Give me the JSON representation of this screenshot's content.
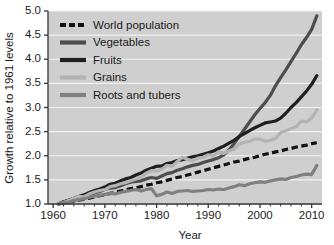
{
  "chart_data": {
    "type": "line",
    "title": "",
    "xlabel": "Year",
    "ylabel": "Growth relative to 1961 levels",
    "xlim": [
      1959,
      2012
    ],
    "ylim": [
      1.0,
      5.0
    ],
    "grid": true,
    "legend_position": "upper left",
    "xticks": [
      1960,
      1970,
      1980,
      1990,
      2000,
      2010
    ],
    "xtick_labels": [
      "1960",
      "1970",
      "1980",
      "1990",
      "2000",
      "2010"
    ],
    "yticks": [
      1.0,
      1.5,
      2.0,
      2.5,
      3.0,
      3.5,
      4.0,
      4.5,
      5.0
    ],
    "ytick_labels": [
      "1.0",
      "1.5",
      "2.0",
      "2.5",
      "3.0",
      "3.5",
      "4.0",
      "4.5",
      "5.0"
    ],
    "x": [
      1961,
      1962,
      1963,
      1964,
      1965,
      1966,
      1967,
      1968,
      1969,
      1970,
      1971,
      1972,
      1973,
      1974,
      1975,
      1976,
      1977,
      1978,
      1979,
      1980,
      1981,
      1982,
      1983,
      1984,
      1985,
      1986,
      1987,
      1988,
      1989,
      1990,
      1991,
      1992,
      1993,
      1994,
      1995,
      1996,
      1997,
      1998,
      1999,
      2000,
      2001,
      2002,
      2003,
      2004,
      2005,
      2006,
      2007,
      2008,
      2009,
      2010,
      2011
    ],
    "series": [
      {
        "name": "World population",
        "style": "dashed",
        "color": "#111111",
        "width": 3.2,
        "values": [
          1.0,
          1.02,
          1.04,
          1.06,
          1.08,
          1.1,
          1.12,
          1.15,
          1.17,
          1.19,
          1.22,
          1.24,
          1.27,
          1.29,
          1.32,
          1.34,
          1.36,
          1.39,
          1.41,
          1.44,
          1.46,
          1.49,
          1.52,
          1.55,
          1.57,
          1.6,
          1.63,
          1.66,
          1.69,
          1.72,
          1.75,
          1.78,
          1.81,
          1.84,
          1.87,
          1.89,
          1.92,
          1.95,
          1.97,
          2.0,
          2.03,
          2.05,
          2.08,
          2.1,
          2.13,
          2.15,
          2.18,
          2.2,
          2.22,
          2.25,
          2.27
        ]
      },
      {
        "name": "Vegetables",
        "style": "solid",
        "color": "#4d4d4d",
        "width": 3.2,
        "values": [
          1.0,
          1.05,
          1.07,
          1.1,
          1.13,
          1.16,
          1.2,
          1.23,
          1.26,
          1.3,
          1.33,
          1.34,
          1.38,
          1.42,
          1.45,
          1.47,
          1.48,
          1.52,
          1.55,
          1.53,
          1.58,
          1.63,
          1.65,
          1.7,
          1.73,
          1.77,
          1.8,
          1.82,
          1.86,
          1.89,
          1.92,
          1.96,
          2.02,
          2.12,
          2.25,
          2.4,
          2.55,
          2.7,
          2.85,
          2.98,
          3.1,
          3.25,
          3.45,
          3.62,
          3.78,
          3.95,
          4.12,
          4.3,
          4.45,
          4.62,
          4.9
        ]
      },
      {
        "name": "Fruits",
        "style": "solid",
        "color": "#1f1f1f",
        "width": 3.2,
        "values": [
          1.0,
          1.04,
          1.08,
          1.12,
          1.16,
          1.19,
          1.24,
          1.28,
          1.31,
          1.35,
          1.41,
          1.43,
          1.48,
          1.52,
          1.55,
          1.6,
          1.64,
          1.7,
          1.74,
          1.78,
          1.79,
          1.84,
          1.86,
          1.9,
          1.92,
          1.95,
          1.98,
          2.0,
          2.03,
          2.06,
          2.1,
          2.15,
          2.2,
          2.26,
          2.32,
          2.4,
          2.46,
          2.52,
          2.58,
          2.63,
          2.68,
          2.7,
          2.72,
          2.78,
          2.88,
          3.0,
          3.1,
          3.22,
          3.34,
          3.48,
          3.66
        ]
      },
      {
        "name": "Grains",
        "style": "solid",
        "color": "#b3b3b3",
        "width": 3.2,
        "values": [
          1.0,
          1.03,
          1.07,
          1.12,
          1.16,
          1.15,
          1.21,
          1.25,
          1.28,
          1.3,
          1.36,
          1.38,
          1.42,
          1.44,
          1.48,
          1.52,
          1.56,
          1.64,
          1.69,
          1.68,
          1.72,
          1.8,
          1.78,
          1.88,
          1.97,
          1.93,
          1.89,
          1.95,
          1.97,
          2.02,
          2.0,
          2.08,
          2.05,
          2.1,
          2.14,
          2.24,
          2.28,
          2.3,
          2.35,
          2.34,
          2.3,
          2.32,
          2.36,
          2.48,
          2.52,
          2.56,
          2.6,
          2.72,
          2.7,
          2.78,
          2.95
        ]
      },
      {
        "name": "Roots and tubers",
        "style": "solid",
        "color": "#808080",
        "width": 3.2,
        "values": [
          1.0,
          1.02,
          1.04,
          1.07,
          1.09,
          1.11,
          1.14,
          1.16,
          1.18,
          1.2,
          1.22,
          1.21,
          1.24,
          1.26,
          1.28,
          1.3,
          1.27,
          1.3,
          1.32,
          1.17,
          1.2,
          1.25,
          1.22,
          1.26,
          1.27,
          1.28,
          1.26,
          1.27,
          1.28,
          1.3,
          1.29,
          1.31,
          1.3,
          1.33,
          1.36,
          1.4,
          1.38,
          1.42,
          1.44,
          1.46,
          1.45,
          1.48,
          1.5,
          1.52,
          1.51,
          1.55,
          1.57,
          1.6,
          1.62,
          1.61,
          1.8
        ]
      }
    ],
    "legend_entries": [
      {
        "label": "World population",
        "style": "dashed",
        "color": "#111111"
      },
      {
        "label": "Vegetables",
        "style": "solid",
        "color": "#4d4d4d"
      },
      {
        "label": "Fruits",
        "style": "solid",
        "color": "#1f1f1f"
      },
      {
        "label": "Grains",
        "style": "solid",
        "color": "#b3b3b3"
      },
      {
        "label": "Roots and tubers",
        "style": "solid",
        "color": "#808080"
      }
    ],
    "colors": {
      "plot_background": "#cfcfcf",
      "gridline": "#f2f2f2",
      "axis": "#333333",
      "figure_background": "#ffffff"
    }
  }
}
